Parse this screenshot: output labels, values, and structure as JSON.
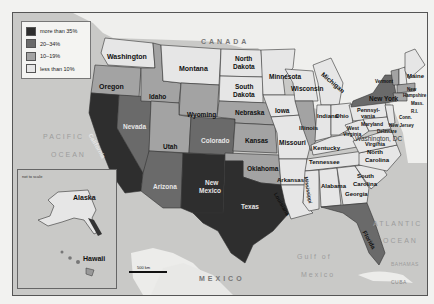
{
  "map": {
    "type": "choropleth",
    "region": "United States",
    "legend": [
      {
        "label": "more than 35%",
        "color": "#2e2e2e"
      },
      {
        "label": "20–34%",
        "color": "#6a6a6a"
      },
      {
        "label": "10–19%",
        "color": "#a3a3a3"
      },
      {
        "label": "less than 10%",
        "color": "#e6e6e6"
      }
    ],
    "water_labels": {
      "pacific_1": "PACIFIC",
      "pacific_2": "OCEAN",
      "atlantic_1": "ATLANTIC",
      "atlantic_2": "OCEAN",
      "gulf_1": "Gulf of",
      "gulf_2": "Mexico"
    },
    "country_labels": {
      "canada": "CANADA",
      "mexico": "MEXICO",
      "bahamas": "BAHAMAS",
      "cuba": "CUBA"
    },
    "inset": {
      "note": "not to scale",
      "alaska": "Alaska",
      "hawaii": "Hawaii"
    },
    "scale": "500 km",
    "capital_label": "Washington, DC",
    "states": {
      "washington": "Washington",
      "oregon": "Oregon",
      "california": "California",
      "nevada": "Nevada",
      "idaho": "Idaho",
      "montana": "Montana",
      "wyoming": "Wyoming",
      "utah": "Utah",
      "arizona": "Arizona",
      "colorado": "Colorado",
      "new_mexico_1": "New",
      "new_mexico_2": "Mexico",
      "north_dakota_1": "North",
      "north_dakota_2": "Dakota",
      "south_dakota_1": "South",
      "south_dakota_2": "Dakota",
      "nebraska": "Nebraska",
      "kansas": "Kansas",
      "oklahoma": "Oklahoma",
      "texas": "Texas",
      "minnesota": "Minnesota",
      "iowa": "Iowa",
      "missouri": "Missouri",
      "arkansas": "Arkansas",
      "louisiana": "Louisiana",
      "wisconsin": "Wisconsin",
      "illinois": "Illinois",
      "michigan": "Michigan",
      "indiana": "Indiana",
      "ohio": "Ohio",
      "kentucky": "Kentucky",
      "tennessee": "Tennessee",
      "mississippi": "Mississippi",
      "alabama": "Alabama",
      "georgia": "Georgia",
      "florida": "Florida",
      "south_carolina_1": "South",
      "south_carolina_2": "Carolina",
      "north_carolina_1": "North",
      "north_carolina_2": "Carolina",
      "virginia": "Virginia",
      "west_virginia_1": "West",
      "west_virginia_2": "Virginia",
      "pennsylvania_1": "Pennsyl-",
      "pennsylvania_2": "vania",
      "new_york": "New York",
      "maryland": "Maryland",
      "delaware": "Delaware",
      "new_jersey": "New Jersey",
      "vermont": "Vermont",
      "new_hampshire_1": "New",
      "new_hampshire_2": "Hampshire",
      "maine": "Maine",
      "massachusetts": "Mass.",
      "rhode_island": "R.I.",
      "connecticut": "Conn."
    }
  }
}
